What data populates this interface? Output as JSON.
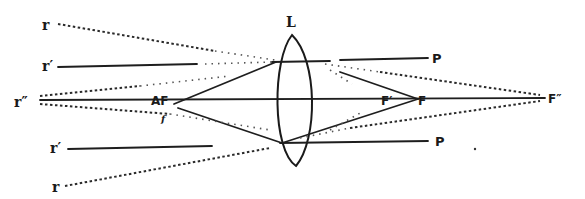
{
  "diagram": {
    "labels": {
      "lens": "L",
      "r_top": "r",
      "r_prime_top": "r′",
      "r_double_prime": "r″",
      "r_prime_bottom": "r′",
      "r_bottom": "r",
      "af": "AF",
      "af_sub": "f",
      "f_prime": "F′",
      "f": "F",
      "f_double_prime": "F″",
      "p_top": "P",
      "p_bottom": "P"
    },
    "colors": {
      "ink": "#1e1e1e",
      "paper": "#ffffff"
    },
    "points": {
      "lens_top": [
        292,
        35
      ],
      "lens_bottom": [
        296,
        166
      ],
      "axis_y": 101,
      "af": [
        165,
        101
      ],
      "f_prime": [
        385,
        101
      ],
      "f": [
        420,
        101
      ],
      "f_double_prime": [
        557,
        97
      ],
      "upper_lens_hit": [
        275,
        62
      ],
      "lower_lens_hit": [
        282,
        143
      ]
    }
  }
}
